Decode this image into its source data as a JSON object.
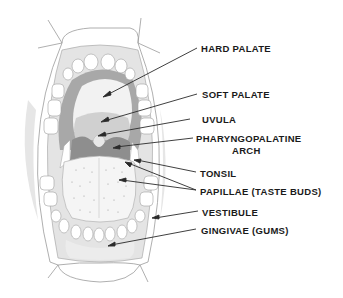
{
  "diagram": {
    "labels": [
      {
        "id": "hard-palate",
        "text": "HARD PALATE",
        "x": 201,
        "y": 43,
        "target": [
          103,
          97
        ]
      },
      {
        "id": "soft-palate",
        "text": "SOFT PALATE",
        "x": 202,
        "y": 89,
        "target": [
          101,
          122
        ]
      },
      {
        "id": "uvula",
        "text": "UVULA",
        "x": 202,
        "y": 114,
        "target": [
          98,
          136
        ]
      },
      {
        "id": "pharyngopalatine-arch",
        "text": "PHARYNGOPALATINE",
        "text2": "ARCH",
        "x": 196,
        "y": 133,
        "target": [
          113,
          148
        ]
      },
      {
        "id": "tonsil",
        "text": "TONSIL",
        "x": 200,
        "y": 168,
        "target": [
          134,
          160
        ]
      },
      {
        "id": "papillae",
        "text": "PAPILLAE (TASTE BUDS)",
        "x": 200,
        "y": 186,
        "targets": [
          [
            125,
            162
          ],
          [
            119,
            180
          ]
        ]
      },
      {
        "id": "vestibule",
        "text": "VESTIBULE",
        "x": 202,
        "y": 207,
        "target": [
          152,
          218
        ]
      },
      {
        "id": "gingivae",
        "text": "GINGIVAE (GUMS)",
        "x": 201,
        "y": 225,
        "target": [
          108,
          246
        ]
      }
    ]
  },
  "colors": {
    "outline": "#9a9a9a",
    "palate_dark": "#a8a8a8",
    "soft_palate": "#c9c9c9",
    "arch_dark": "#8e8e8e",
    "tongue": "#f4f4f4",
    "teeth": "#ffffff",
    "gum": "#e2e2e2",
    "label": "#1a1a1a",
    "leader": "#2a2a2a"
  }
}
